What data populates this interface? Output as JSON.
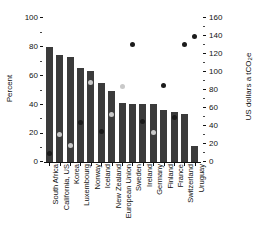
{
  "chart_data": {
    "type": "bar",
    "title": "",
    "xlabel": "",
    "ylabel": "Percent",
    "ylabel_right": "US dollars a tCO2e",
    "ylim": [
      0,
      100
    ],
    "ylim_right": [
      0,
      160
    ],
    "grid": false,
    "legend": "none",
    "categories": [
      "South Africa",
      "California, US",
      "Korea",
      "Luxembourg",
      "Norway",
      "Iceland",
      "New Zealand",
      "European Union",
      "Sweden",
      "Ireland",
      "Germany",
      "Finland",
      "France",
      "Switzerland",
      "Uruguay"
    ],
    "series": [
      {
        "name": "Share of emissions covered",
        "type": "bar",
        "axis": "left",
        "unit": "Percent",
        "color": "#3b3b3b",
        "values": [
          80,
          74,
          73,
          65,
          63,
          55,
          49,
          41,
          40,
          40,
          40,
          36,
          35,
          33,
          11
        ]
      },
      {
        "name": "Carbon price",
        "type": "scatter",
        "axis": "right",
        "unit": "US dollars a tCO2e",
        "color": "#1b1b1b",
        "color_light": "#c9c9c9",
        "values": [
          10,
          31,
          18,
          44,
          88,
          34,
          53,
          84,
          131,
          45,
          33,
          85,
          49,
          131,
          139
        ],
        "marker_shades": [
          "dark",
          "light",
          "light",
          "dark",
          "light",
          "dark",
          "light",
          "light",
          "dark",
          "dark",
          "light",
          "dark",
          "dark",
          "dark",
          "dark"
        ]
      }
    ],
    "yticks_left": [
      "100",
      "80",
      "60",
      "40",
      "20",
      "0"
    ],
    "yticks_right": [
      "160",
      "140",
      "120",
      "100",
      "80",
      "60",
      "40",
      "20",
      "0"
    ]
  }
}
